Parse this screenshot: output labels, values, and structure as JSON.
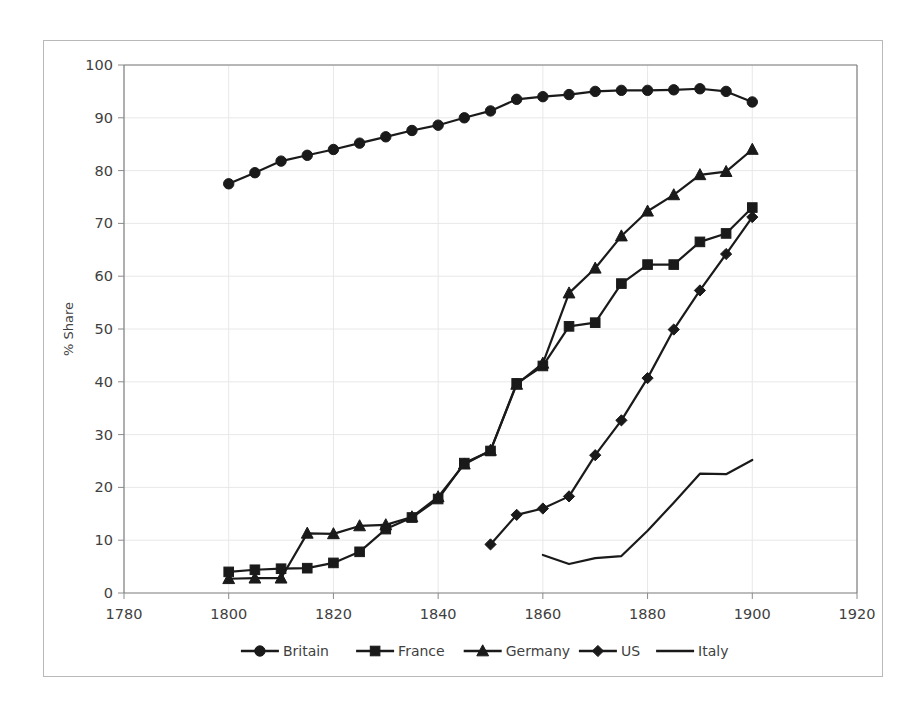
{
  "chart_data": {
    "type": "line",
    "title": "",
    "xlabel": "",
    "ylabel": "% Share",
    "xlim": [
      1780,
      1920
    ],
    "ylim": [
      0,
      100
    ],
    "xticks": [
      1780,
      1800,
      1820,
      1840,
      1860,
      1880,
      1900,
      1920
    ],
    "yticks": [
      0,
      10,
      20,
      30,
      40,
      50,
      60,
      70,
      80,
      90,
      100
    ],
    "grid": true,
    "legend_position": "bottom",
    "series": [
      {
        "name": "Britain",
        "marker": "circle",
        "x": [
          1800,
          1805,
          1810,
          1815,
          1820,
          1825,
          1830,
          1835,
          1840,
          1845,
          1850,
          1855,
          1860,
          1865,
          1870,
          1875,
          1880,
          1885,
          1890,
          1895,
          1900
        ],
        "values": [
          77.5,
          79.6,
          81.8,
          82.9,
          84.0,
          85.2,
          86.4,
          87.6,
          88.6,
          90.0,
          91.3,
          93.5,
          94.0,
          94.4,
          95.0,
          95.2,
          95.2,
          95.3,
          95.5,
          95.0,
          93.0
        ]
      },
      {
        "name": "France",
        "marker": "square",
        "x": [
          1800,
          1805,
          1810,
          1815,
          1820,
          1825,
          1830,
          1835,
          1840,
          1845,
          1850,
          1855,
          1860,
          1865,
          1870,
          1875,
          1880,
          1885,
          1890,
          1895,
          1900
        ],
        "values": [
          4.0,
          4.4,
          4.6,
          4.7,
          5.7,
          7.8,
          12.1,
          14.3,
          17.8,
          24.6,
          26.9,
          39.7,
          43.0,
          50.5,
          51.2,
          58.6,
          62.2,
          62.2,
          66.5,
          68.1,
          73.0
        ]
      },
      {
        "name": "Germany",
        "marker": "triangle",
        "x": [
          1800,
          1805,
          1810,
          1815,
          1820,
          1825,
          1830,
          1835,
          1840,
          1845,
          1850,
          1855,
          1860,
          1865,
          1870,
          1875,
          1880,
          1885,
          1890,
          1895,
          1900
        ],
        "values": [
          2.7,
          2.8,
          2.8,
          11.3,
          11.2,
          12.7,
          12.9,
          14.4,
          18.2,
          24.4,
          27.0,
          39.5,
          43.5,
          56.8,
          61.5,
          67.6,
          72.3,
          75.4,
          79.2,
          79.8,
          84.0
        ]
      },
      {
        "name": "US",
        "marker": "diamond",
        "x": [
          1850,
          1855,
          1860,
          1865,
          1870,
          1875,
          1880,
          1885,
          1890,
          1895,
          1900
        ],
        "values": [
          9.2,
          14.8,
          16.0,
          18.3,
          26.1,
          32.7,
          40.7,
          49.9,
          57.3,
          64.2,
          71.2
        ]
      },
      {
        "name": "Italy",
        "marker": "none",
        "x": [
          1860,
          1865,
          1870,
          1875,
          1880,
          1885,
          1890,
          1895,
          1900
        ],
        "values": [
          7.2,
          5.5,
          6.6,
          7.0,
          11.8,
          17.1,
          22.6,
          22.5,
          25.2
        ]
      }
    ]
  },
  "axis": {
    "ylabel": "% Share",
    "ytick_labels": [
      "0",
      "10",
      "20",
      "30",
      "40",
      "50",
      "60",
      "70",
      "80",
      "90",
      "100"
    ],
    "xtick_labels": [
      "1780",
      "1800",
      "1820",
      "1840",
      "1860",
      "1880",
      "1900",
      "1920"
    ]
  },
  "legend": {
    "items": [
      {
        "label": "Britain",
        "marker": "circle"
      },
      {
        "label": "France",
        "marker": "square"
      },
      {
        "label": "Germany",
        "marker": "triangle"
      },
      {
        "label": "US",
        "marker": "diamond"
      },
      {
        "label": "Italy",
        "marker": "none"
      }
    ]
  },
  "colors": {
    "series_stroke": "#1a1a1a",
    "grid": "#e8e8e8",
    "axis": "#7a7a7a",
    "text": "#3f3f3f",
    "frame": "#b9b9b9",
    "background": "#ffffff"
  }
}
